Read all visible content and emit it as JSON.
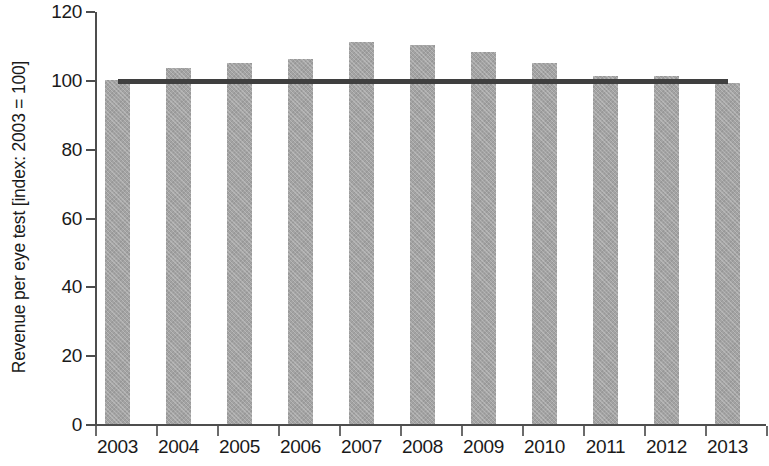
{
  "chart_data": {
    "type": "bar",
    "title": "",
    "subtitle": "",
    "xlabel": "",
    "ylabel": "Revenue per eye test [index: 2003 = 100]",
    "categories": [
      "2003",
      "2004",
      "2005",
      "2006",
      "2007",
      "2008",
      "2009",
      "2010",
      "2011",
      "2012",
      "2013"
    ],
    "values": [
      100,
      103.5,
      105,
      106,
      111,
      110,
      108,
      105,
      101,
      101,
      99
    ],
    "series": [
      {
        "name": "Revenue per eye test",
        "type": "bar",
        "values": [
          100,
          103.5,
          105,
          106,
          111,
          110,
          108,
          105,
          101,
          101,
          99
        ],
        "color": "#a3a3a3"
      },
      {
        "name": "Reference level (index = 100)",
        "type": "line",
        "values": [
          100,
          100,
          100,
          100,
          100,
          100,
          100,
          100,
          100,
          100,
          100
        ],
        "color": "#3f3f3f"
      }
    ],
    "ylim": [
      0,
      120
    ],
    "yticks": [
      0,
      20,
      40,
      60,
      80,
      100,
      120
    ],
    "ytick_labels": [
      "0",
      "20",
      "40",
      "60",
      "80",
      "100",
      "120"
    ],
    "xlim_categories": [
      "2003",
      "2013"
    ],
    "grid": false,
    "legend": false,
    "legend_position": "none",
    "annotations": [],
    "reference_line_value": 100,
    "colors": {
      "bar_fill": "#a3a3a3",
      "reference_line": "#3f3f3f",
      "axis": "#4d4d4d",
      "text": "#1a1a1a",
      "background": "#ffffff"
    }
  }
}
